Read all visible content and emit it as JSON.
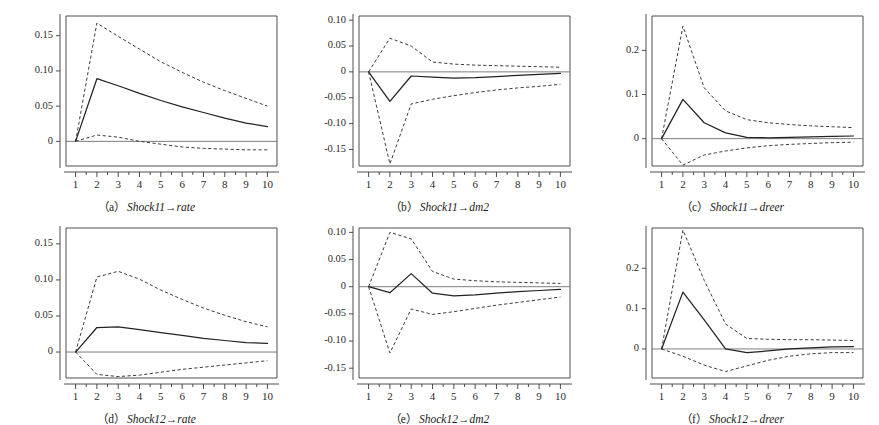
{
  "figure": {
    "type": "impulse-response-grid",
    "rows": 2,
    "columns": 3,
    "background_color": "#ffffff",
    "line_color": "#222222",
    "band_color": "#3c3c3c",
    "axis_color": "#3a3a3a"
  },
  "chart_data": [
    {
      "id": "panel-a",
      "type": "line",
      "title": "",
      "caption_letter": "（a）",
      "caption_text": "Shock11→rate",
      "xlabel": "",
      "ylabel": "",
      "x": [
        1,
        2,
        3,
        4,
        5,
        6,
        7,
        8,
        9,
        10
      ],
      "xlim": [
        0.55,
        10.45
      ],
      "ylim": [
        -0.035,
        0.178
      ],
      "xticks": [
        1,
        2,
        3,
        4,
        5,
        6,
        7,
        8,
        9,
        10
      ],
      "xtick_labels": [
        "1",
        "2",
        "3",
        "4",
        "5",
        "6",
        "7",
        "8",
        "9",
        "10"
      ],
      "yticks": [
        0,
        0.05,
        0.1,
        0.15
      ],
      "ytick_labels": [
        "0",
        "0.05",
        "0.10",
        "0.15"
      ],
      "grid": false,
      "legend": "none",
      "zero_line": 0,
      "series": [
        {
          "name": "upper 95% band",
          "style": "dashed",
          "values": [
            0.0,
            0.168,
            0.149,
            0.131,
            0.113,
            0.098,
            0.084,
            0.072,
            0.061,
            0.05
          ]
        },
        {
          "name": "impulse response",
          "style": "solid",
          "values": [
            0.0,
            0.089,
            0.079,
            0.068,
            0.058,
            0.049,
            0.041,
            0.033,
            0.026,
            0.021
          ]
        },
        {
          "name": "lower 95% band",
          "style": "dashed",
          "values": [
            0.0,
            0.009,
            0.006,
            0.0,
            -0.004,
            -0.008,
            -0.01,
            -0.011,
            -0.012,
            -0.012
          ]
        }
      ]
    },
    {
      "id": "panel-b",
      "type": "line",
      "title": "",
      "caption_letter": "（b）",
      "caption_text": "Shock11→dm2",
      "xlabel": "",
      "ylabel": "",
      "x": [
        1,
        2,
        3,
        4,
        5,
        6,
        7,
        8,
        9,
        10
      ],
      "xlim": [
        0.55,
        10.45
      ],
      "ylim": [
        -0.182,
        0.108
      ],
      "xticks": [
        1,
        2,
        3,
        4,
        5,
        6,
        7,
        8,
        9,
        10
      ],
      "xtick_labels": [
        "1",
        "2",
        "3",
        "4",
        "5",
        "6",
        "7",
        "8",
        "9",
        "10"
      ],
      "yticks": [
        -0.15,
        -0.1,
        -0.05,
        0,
        0.05,
        0.1
      ],
      "ytick_labels": [
        "-0.15",
        "-0.10",
        "-0.05",
        "0",
        "0.05",
        "0.10"
      ],
      "grid": false,
      "legend": "none",
      "zero_line": 0,
      "series": [
        {
          "name": "upper 95% band",
          "style": "dashed",
          "values": [
            0.0,
            0.065,
            0.05,
            0.019,
            0.015,
            0.013,
            0.012,
            0.011,
            0.01,
            0.009
          ]
        },
        {
          "name": "impulse response",
          "style": "solid",
          "values": [
            0.0,
            -0.057,
            -0.008,
            -0.01,
            -0.012,
            -0.011,
            -0.009,
            -0.007,
            -0.005,
            -0.003
          ]
        },
        {
          "name": "lower 95% band",
          "style": "dashed",
          "values": [
            0.0,
            -0.178,
            -0.062,
            -0.053,
            -0.046,
            -0.04,
            -0.035,
            -0.031,
            -0.028,
            -0.024
          ]
        }
      ]
    },
    {
      "id": "panel-c",
      "type": "line",
      "title": "",
      "caption_letter": "（c）",
      "caption_text": "Shock11→dreer",
      "xlabel": "",
      "ylabel": "",
      "x": [
        1,
        2,
        3,
        4,
        5,
        6,
        7,
        8,
        9,
        10
      ],
      "xlim": [
        0.55,
        10.45
      ],
      "ylim": [
        -0.062,
        0.278
      ],
      "xticks": [
        1,
        2,
        3,
        4,
        5,
        6,
        7,
        8,
        9,
        10
      ],
      "xtick_labels": [
        "1",
        "2",
        "3",
        "4",
        "5",
        "6",
        "7",
        "8",
        "9",
        "10"
      ],
      "yticks": [
        0,
        0.1,
        0.2
      ],
      "ytick_labels": [
        "0",
        "0.1",
        "0.2"
      ],
      "grid": false,
      "legend": "none",
      "zero_line": 0,
      "series": [
        {
          "name": "upper 95% band",
          "style": "dashed",
          "values": [
            0.0,
            0.255,
            0.115,
            0.063,
            0.043,
            0.036,
            0.032,
            0.029,
            0.027,
            0.025
          ]
        },
        {
          "name": "impulse response",
          "style": "solid",
          "values": [
            0.0,
            0.089,
            0.036,
            0.013,
            0.003,
            0.002,
            0.003,
            0.004,
            0.005,
            0.006
          ]
        },
        {
          "name": "lower 95% band",
          "style": "dashed",
          "values": [
            0.0,
            -0.06,
            -0.037,
            -0.028,
            -0.021,
            -0.016,
            -0.013,
            -0.011,
            -0.009,
            -0.008
          ]
        }
      ]
    },
    {
      "id": "panel-d",
      "type": "line",
      "title": "",
      "caption_letter": "（d）",
      "caption_text": "Shock12→rate",
      "xlabel": "",
      "ylabel": "",
      "x": [
        1,
        2,
        3,
        4,
        5,
        6,
        7,
        8,
        9,
        10
      ],
      "xlim": [
        0.55,
        10.45
      ],
      "ylim": [
        -0.036,
        0.172
      ],
      "xticks": [
        1,
        2,
        3,
        4,
        5,
        6,
        7,
        8,
        9,
        10
      ],
      "xtick_labels": [
        "1",
        "2",
        "3",
        "4",
        "5",
        "6",
        "7",
        "8",
        "9",
        "10"
      ],
      "yticks": [
        0,
        0.05,
        0.1,
        0.15
      ],
      "ytick_labels": [
        "0",
        "0.05",
        "0.10",
        "0.15"
      ],
      "grid": false,
      "legend": "none",
      "zero_line": 0,
      "series": [
        {
          "name": "upper 95% band",
          "style": "dashed",
          "values": [
            0.0,
            0.104,
            0.112,
            0.101,
            0.086,
            0.073,
            0.061,
            0.051,
            0.042,
            0.035
          ]
        },
        {
          "name": "impulse response",
          "style": "solid",
          "values": [
            0.0,
            0.034,
            0.035,
            0.031,
            0.027,
            0.023,
            0.019,
            0.016,
            0.013,
            0.012
          ]
        },
        {
          "name": "lower 95% band",
          "style": "dashed",
          "values": [
            0.0,
            -0.031,
            -0.034,
            -0.032,
            -0.028,
            -0.024,
            -0.021,
            -0.018,
            -0.015,
            -0.012
          ]
        }
      ]
    },
    {
      "id": "panel-e",
      "type": "line",
      "title": "",
      "caption_letter": "（e）",
      "caption_text": "Shock12→dm2",
      "xlabel": "",
      "ylabel": "",
      "x": [
        1,
        2,
        3,
        4,
        5,
        6,
        7,
        8,
        9,
        10
      ],
      "xlim": [
        0.55,
        10.45
      ],
      "ylim": [
        -0.168,
        0.108
      ],
      "xticks": [
        1,
        2,
        3,
        4,
        5,
        6,
        7,
        8,
        9,
        10
      ],
      "xtick_labels": [
        "1",
        "2",
        "3",
        "4",
        "5",
        "6",
        "7",
        "8",
        "9",
        "10"
      ],
      "yticks": [
        -0.15,
        -0.1,
        -0.05,
        0,
        0.05,
        0.1
      ],
      "ytick_labels": [
        "-0.15",
        "-0.10",
        "-0.05",
        "0",
        "0.05",
        "0.10"
      ],
      "grid": false,
      "legend": "none",
      "zero_line": 0,
      "series": [
        {
          "name": "upper 95% band",
          "style": "dashed",
          "values": [
            0.0,
            0.1,
            0.088,
            0.028,
            0.014,
            0.011,
            0.009,
            0.008,
            0.007,
            0.006
          ]
        },
        {
          "name": "impulse response",
          "style": "solid",
          "values": [
            0.0,
            -0.011,
            0.024,
            -0.012,
            -0.017,
            -0.015,
            -0.012,
            -0.009,
            -0.007,
            -0.005
          ]
        },
        {
          "name": "lower 95% band",
          "style": "dashed",
          "values": [
            0.0,
            -0.122,
            -0.041,
            -0.051,
            -0.046,
            -0.04,
            -0.034,
            -0.029,
            -0.024,
            -0.019
          ]
        }
      ]
    },
    {
      "id": "panel-f",
      "type": "line",
      "title": "",
      "caption_letter": "（f）",
      "caption_text": "Shock12→dreer",
      "xlabel": "",
      "ylabel": "",
      "x": [
        1,
        2,
        3,
        4,
        5,
        6,
        7,
        8,
        9,
        10
      ],
      "xlim": [
        0.55,
        10.45
      ],
      "ylim": [
        -0.072,
        0.3
      ],
      "xticks": [
        1,
        2,
        3,
        4,
        5,
        6,
        7,
        8,
        9,
        10
      ],
      "xtick_labels": [
        "1",
        "2",
        "3",
        "4",
        "5",
        "6",
        "7",
        "8",
        "9",
        "10"
      ],
      "yticks": [
        0,
        0.1,
        0.2
      ],
      "ytick_labels": [
        "0",
        "0.1",
        "0.2"
      ],
      "grid": false,
      "legend": "none",
      "zero_line": 0,
      "series": [
        {
          "name": "upper 95% band",
          "style": "dashed",
          "values": [
            0.0,
            0.295,
            0.17,
            0.062,
            0.026,
            0.024,
            0.023,
            0.023,
            0.022,
            0.021
          ]
        },
        {
          "name": "impulse response",
          "style": "solid",
          "values": [
            0.0,
            0.141,
            0.072,
            0.0,
            -0.009,
            -0.005,
            0.0,
            0.003,
            0.005,
            0.006
          ]
        },
        {
          "name": "lower 95% band",
          "style": "dashed",
          "values": [
            0.0,
            -0.018,
            -0.04,
            -0.056,
            -0.042,
            -0.028,
            -0.018,
            -0.012,
            -0.009,
            -0.009
          ]
        }
      ]
    }
  ]
}
